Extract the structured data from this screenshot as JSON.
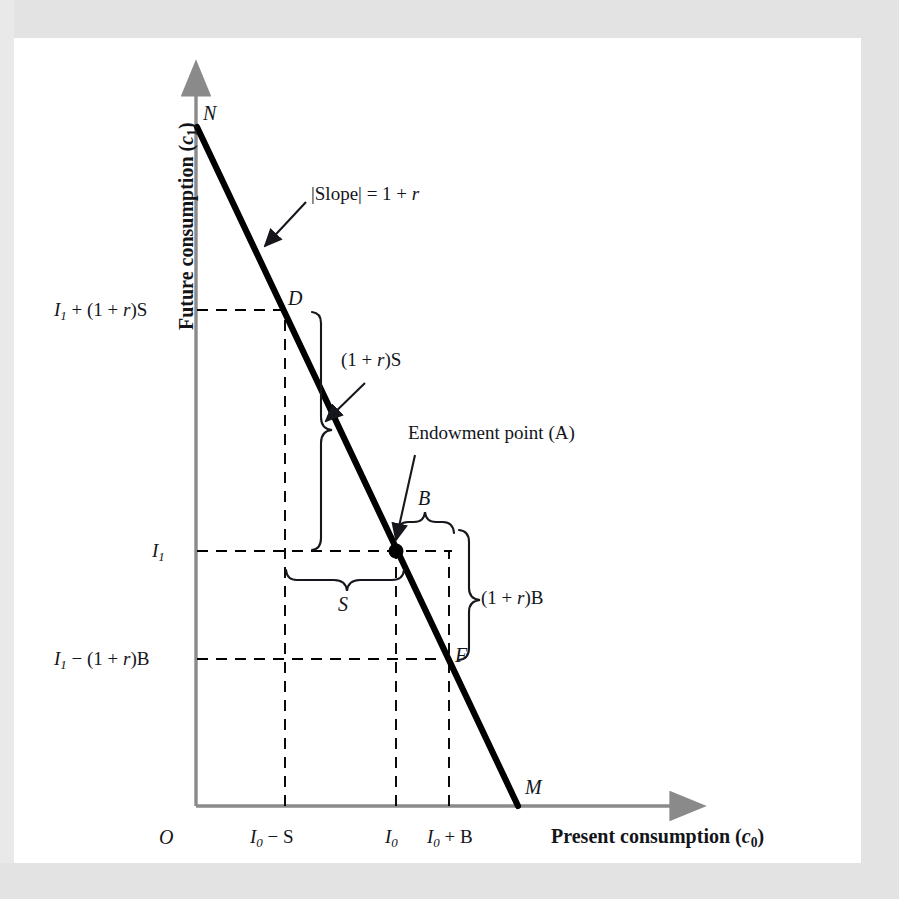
{
  "figure": {
    "type": "intertemporal-budget-constraint-diagram",
    "background_color": "#ffffff",
    "border_color": "#e3e3e3",
    "line_color": "#000000",
    "axis_color": "#808080",
    "dash_color": "#000000"
  },
  "axes": {
    "y_title_prefix": "Future consumption (",
    "y_title_var": "c",
    "y_title_sub": "1",
    "y_title_suffix": ")",
    "x_title_prefix": "Present consumption (",
    "x_title_var": "c",
    "x_title_sub": "0",
    "x_title_suffix": ")",
    "origin_label": "O"
  },
  "y_ticks": [
    {
      "id": "y-tick-high",
      "text_main": "I",
      "text_sub": "1",
      "text_rest": " + (1 + r)S",
      "value_expr": "I1 + (1 + r)S"
    },
    {
      "id": "y-tick-mid",
      "text_main": "I",
      "text_sub": "1",
      "text_rest": "",
      "value_expr": "I1"
    },
    {
      "id": "y-tick-low",
      "text_main": "I",
      "text_sub": "1",
      "text_rest": " − (1 + r)B",
      "value_expr": "I1 - (1 + r)B"
    }
  ],
  "x_ticks": [
    {
      "id": "x-tick-isub",
      "text_main": "I",
      "text_sub": "0",
      "text_rest": " − S",
      "value_expr": "I0 - S"
    },
    {
      "id": "x-tick-i0",
      "text_main": "I",
      "text_sub": "0",
      "text_rest": "",
      "value_expr": "I0"
    },
    {
      "id": "x-tick-iadd",
      "text_main": "I",
      "text_sub": "0",
      "text_rest": " + B",
      "value_expr": "I0 + B"
    }
  ],
  "points": [
    {
      "id": "point-N",
      "label": "N",
      "desc": "y-intercept of budget line"
    },
    {
      "id": "point-D",
      "label": "D",
      "desc": "saving point on budget line"
    },
    {
      "id": "point-F",
      "label": "F",
      "desc": "borrowing point on budget line"
    },
    {
      "id": "point-M",
      "label": "M",
      "desc": "x-intercept of budget line"
    },
    {
      "id": "point-A",
      "label": "A",
      "desc": "endowment point"
    }
  ],
  "annotations": {
    "slope": {
      "prefix": "|Slope| = 1 + ",
      "var": "r"
    },
    "future_value_saving": "(1 + r)S",
    "future_value_borrowing": "(1 + r)B",
    "endowment": "Endowment point (A)",
    "saving_brace": "S",
    "borrowing_brace": "B"
  },
  "chart_data": {
    "type": "line",
    "title": "",
    "xlabel": "Present consumption (c0)",
    "ylabel": "Future consumption (c1)",
    "series": [
      {
        "name": "Budget line NM",
        "points": [
          {
            "label": "N",
            "x": 0,
            "y": 1.0
          },
          {
            "label": "D",
            "x": 0.255,
            "y": 0.745
          },
          {
            "label": "A",
            "x": 0.5,
            "y": 0.5
          },
          {
            "label": "F",
            "x": 0.675,
            "y": 0.325
          },
          {
            "label": "M",
            "x": 1.0,
            "y": 0
          }
        ]
      }
    ],
    "axis_ranges": {
      "x": [
        0,
        1.15
      ],
      "y": [
        0,
        1.12
      ]
    },
    "grid": false,
    "legend": "none",
    "slope_expression": "|Slope| = 1 + r"
  }
}
